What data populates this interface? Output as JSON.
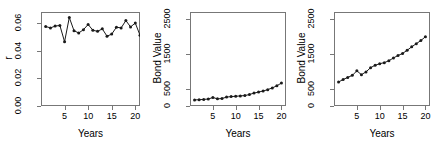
{
  "figure": {
    "title": "",
    "layout": "1 row by 3 columns",
    "background": "#ffffff",
    "line_color": "#1a1a1a",
    "frame_color": "#777777",
    "point_color": "#1a1a1a"
  },
  "chart_data": [
    {
      "type": "line",
      "title": "",
      "xlabel": "Years",
      "ylabel": "r",
      "xlim": [
        0,
        21
      ],
      "ylim": [
        0.0,
        0.068
      ],
      "grid": false,
      "legend": null,
      "xticks": [
        5,
        10,
        15,
        20
      ],
      "xtick_labels": [
        "5",
        "10",
        "15",
        "20"
      ],
      "yticks": [
        0.0,
        0.02,
        0.04,
        0.06
      ],
      "ytick_labels": [
        "0.00",
        "0.02",
        "0.04",
        "0.06"
      ],
      "markers": "filled-circle",
      "x": [
        1,
        2,
        3,
        4,
        5,
        6,
        7,
        8,
        9,
        10,
        11,
        12,
        13,
        14,
        15,
        16,
        17,
        18,
        19,
        20,
        21
      ],
      "values": [
        0.0575,
        0.0565,
        0.0578,
        0.0583,
        0.0465,
        0.064,
        0.0545,
        0.0528,
        0.0552,
        0.059,
        0.0548,
        0.054,
        0.0558,
        0.0505,
        0.052,
        0.057,
        0.0565,
        0.0618,
        0.0572,
        0.06,
        0.0512
      ],
      "series_name": "r"
    },
    {
      "type": "line",
      "title": "",
      "xlabel": "Years",
      "ylabel": "Bond Value",
      "xlim": [
        0,
        21
      ],
      "ylim": [
        0,
        2700
      ],
      "grid": false,
      "legend": null,
      "xticks": [
        5,
        10,
        15,
        20
      ],
      "xtick_labels": [
        "5",
        "10",
        "15",
        "20"
      ],
      "yticks": [
        0,
        500,
        1500,
        2500
      ],
      "ytick_labels": [
        "0",
        "500",
        "1500",
        "2500"
      ],
      "markers": "filled-circle",
      "x": [
        1,
        2,
        3,
        4,
        5,
        6,
        7,
        8,
        9,
        10,
        11,
        12,
        13,
        14,
        15,
        16,
        17,
        18,
        19,
        20
      ],
      "values": [
        175,
        180,
        190,
        200,
        245,
        205,
        215,
        255,
        270,
        280,
        290,
        300,
        330,
        370,
        400,
        430,
        470,
        520,
        580,
        660,
        745
      ],
      "series_name": "Bond Value"
    },
    {
      "type": "line",
      "title": "",
      "xlabel": "Years",
      "ylabel": "Bond Value",
      "xlim": [
        0,
        21
      ],
      "ylim": [
        0,
        2700
      ],
      "grid": false,
      "legend": null,
      "xticks": [
        5,
        10,
        15,
        20
      ],
      "xtick_labels": [
        "5",
        "10",
        "15",
        "20"
      ],
      "yticks": [
        0,
        500,
        1500,
        2500
      ],
      "ytick_labels": [
        "0",
        "500",
        "1500",
        "2500"
      ],
      "markers": "filled-circle",
      "x": [
        1,
        2,
        3,
        4,
        5,
        6,
        7,
        8,
        9,
        10,
        11,
        12,
        13,
        14,
        15,
        16,
        17,
        18,
        19,
        20
      ],
      "values": [
        690,
        760,
        820,
        880,
        1010,
        900,
        980,
        1100,
        1170,
        1215,
        1245,
        1300,
        1380,
        1450,
        1510,
        1600,
        1700,
        1790,
        1880,
        1990,
        2150
      ],
      "series_name": "Bond Value"
    }
  ]
}
